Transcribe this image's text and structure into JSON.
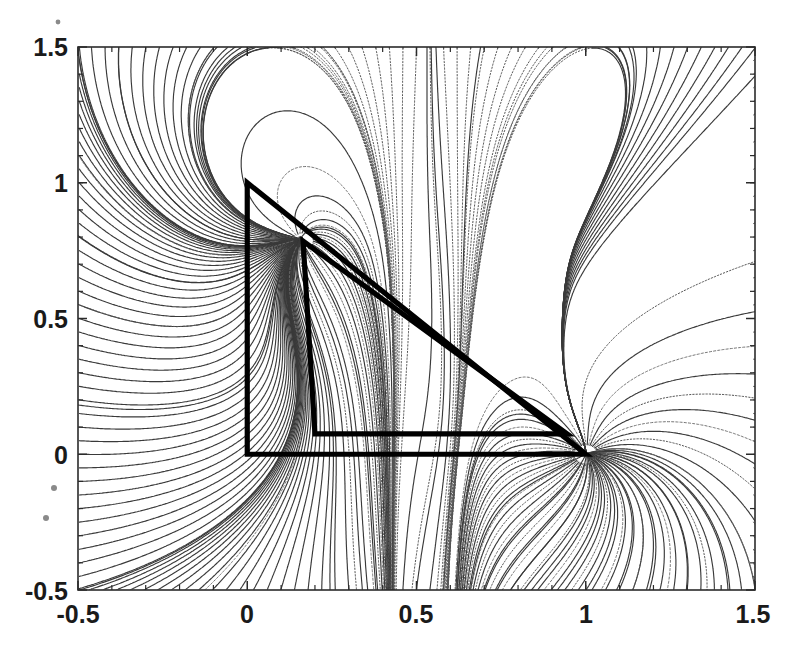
{
  "figure": {
    "title": "",
    "caption": ""
  },
  "chart_data": {
    "type": "line",
    "title": "",
    "subtitle": "",
    "xlabel": "",
    "ylabel": "",
    "xlim": [
      -0.5,
      1.5
    ],
    "ylim": [
      -0.5,
      1.5
    ],
    "xticks": [
      -0.5,
      0,
      0.5,
      1,
      1.5
    ],
    "xtick_labels": [
      "-0.5",
      "0",
      "0.5",
      "1",
      "1.5"
    ],
    "yticks": [
      -0.5,
      0,
      0.5,
      1,
      1.5
    ],
    "ytick_labels": [
      "-0.5",
      "0",
      "0.5",
      "1",
      "1.5"
    ],
    "minor_tick_step": 0.1,
    "grid": false,
    "legend": null,
    "legend_position": "none",
    "series": [
      {
        "name": "outer-triangle",
        "kind": "polygon",
        "closed": true,
        "linewidth": "heavy",
        "color": "#000000",
        "points": [
          [
            0.0,
            1.0
          ],
          [
            0.0,
            0.0
          ],
          [
            1.0,
            0.0
          ]
        ]
      },
      {
        "name": "inner-triangle",
        "kind": "polygon",
        "closed": true,
        "linewidth": "heavy",
        "color": "#000000",
        "points": [
          [
            0.165,
            0.785
          ],
          [
            0.2,
            0.075
          ],
          [
            0.945,
            0.075
          ]
        ]
      }
    ],
    "singular_points": [
      {
        "name": "right-focus",
        "x": 1.0,
        "y": 0.0,
        "type": "convergence-node"
      },
      {
        "name": "upper-spine-a",
        "x": 0.44,
        "y": 1.5,
        "type": "separatrix-spine"
      },
      {
        "name": "upper-spine-b",
        "x": 0.63,
        "y": 1.5,
        "type": "separatrix-spine"
      },
      {
        "name": "apex-focus",
        "x": 0.165,
        "y": 0.785,
        "type": "convergence-node"
      }
    ],
    "stream_density": "high",
    "stream_color": "#3a3a3a"
  },
  "axes": {
    "frame_color": "#2b2b2b",
    "x_tick_labels": [
      "-0.5",
      "0",
      "0.5",
      "1",
      "1.5"
    ],
    "y_tick_labels": [
      "-0.5",
      "0",
      "0.5",
      "1",
      "1.5"
    ]
  },
  "artifacts": {
    "note": "scanned page speckles in left margin",
    "specks": [
      {
        "x": 58,
        "y": 22,
        "r": 2.4
      },
      {
        "x": 54,
        "y": 488,
        "r": 3.0
      },
      {
        "x": 46,
        "y": 518,
        "r": 3.0
      }
    ]
  }
}
